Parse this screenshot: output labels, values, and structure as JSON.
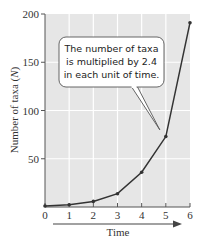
{
  "chart_data": {
    "type": "line",
    "title": "",
    "xlabel": "Time",
    "ylabel": "Number of taxa",
    "ylabel_symbol": "N",
    "x": [
      0,
      1,
      2,
      3,
      4,
      5,
      6
    ],
    "series": [
      {
        "name": "Number of taxa (N)",
        "values": [
          1,
          2.4,
          5.8,
          13.8,
          36,
          73,
          191
        ]
      }
    ],
    "xlim": [
      0,
      6
    ],
    "ylim": [
      0,
      200
    ],
    "x_ticks": [
      "0",
      "1",
      "2",
      "3",
      "4",
      "5",
      "6"
    ],
    "y_ticks": [
      "50",
      "100",
      "150",
      "200"
    ],
    "grid": true,
    "annotation": {
      "lines": [
        "The number of taxa",
        "is multiplied by 2.4",
        "in each unit of time."
      ],
      "points_to": {
        "x": 4.75,
        "y": 80
      }
    },
    "colors": {
      "plot_background": "#e6e6e6",
      "gridline": "#ffffff",
      "line": "#333333",
      "text": "#333333"
    }
  }
}
